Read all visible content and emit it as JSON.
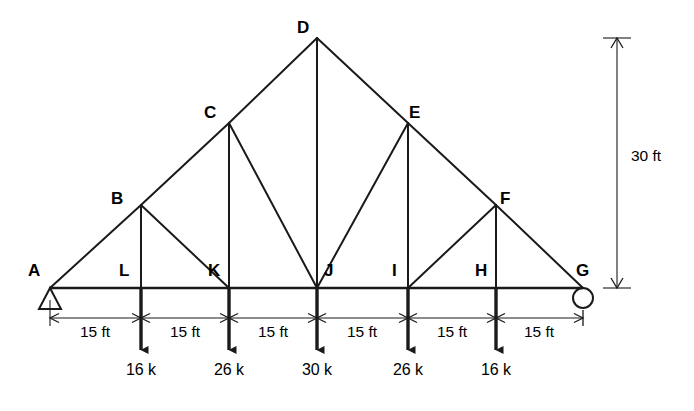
{
  "figure": {
    "type": "structural-truss-diagram",
    "background_color": "#ffffff",
    "line_color": "#1a1a1a"
  },
  "geometry": {
    "span_ft": 90,
    "height_ft": 30,
    "panel_length_ft": 15,
    "panel_count": 6
  },
  "nodes": [
    {
      "id": "A",
      "label": "A",
      "x": 50,
      "y": 288,
      "label_x": 28,
      "label_y": 262,
      "chord": "bottom"
    },
    {
      "id": "L",
      "label": "L",
      "x": 141,
      "y": 288,
      "label_x": 119,
      "label_y": 262,
      "chord": "bottom"
    },
    {
      "id": "K",
      "label": "K",
      "x": 229,
      "y": 288,
      "label_x": 208,
      "label_y": 262,
      "chord": "bottom"
    },
    {
      "id": "J",
      "label": "J",
      "x": 317,
      "y": 288,
      "label_x": 324,
      "label_y": 262,
      "chord": "bottom"
    },
    {
      "id": "I",
      "label": "I",
      "x": 408,
      "y": 288,
      "label_x": 392,
      "label_y": 262,
      "chord": "bottom"
    },
    {
      "id": "H",
      "label": "H",
      "x": 496,
      "y": 288,
      "label_x": 475,
      "label_y": 262,
      "chord": "bottom"
    },
    {
      "id": "G",
      "label": "G",
      "x": 583,
      "y": 288,
      "label_x": 576,
      "label_y": 262,
      "chord": "bottom"
    },
    {
      "id": "B",
      "label": "B",
      "x": 141,
      "y": 205,
      "label_x": 111,
      "label_y": 190,
      "chord": "top"
    },
    {
      "id": "C",
      "label": "C",
      "x": 229,
      "y": 123,
      "label_x": 204,
      "label_y": 104,
      "chord": "top"
    },
    {
      "id": "D",
      "label": "D",
      "x": 317,
      "y": 38,
      "label_x": 297,
      "label_y": 19,
      "chord": "top"
    },
    {
      "id": "E",
      "label": "E",
      "x": 408,
      "y": 123,
      "label_x": 409,
      "label_y": 104,
      "chord": "top"
    },
    {
      "id": "F",
      "label": "F",
      "x": 496,
      "y": 205,
      "label_x": 500,
      "label_y": 190,
      "chord": "top"
    }
  ],
  "members": {
    "bottom_chord": [
      [
        "A",
        "L"
      ],
      [
        "L",
        "K"
      ],
      [
        "K",
        "J"
      ],
      [
        "J",
        "I"
      ],
      [
        "I",
        "H"
      ],
      [
        "H",
        "G"
      ]
    ],
    "top_chord": [
      [
        "A",
        "B"
      ],
      [
        "B",
        "C"
      ],
      [
        "C",
        "D"
      ],
      [
        "D",
        "E"
      ],
      [
        "E",
        "F"
      ],
      [
        "F",
        "G"
      ]
    ],
    "verticals": [
      [
        "B",
        "L"
      ],
      [
        "C",
        "K"
      ],
      [
        "D",
        "J"
      ],
      [
        "E",
        "I"
      ],
      [
        "F",
        "H"
      ]
    ],
    "diagonals": [
      [
        "B",
        "K"
      ],
      [
        "C",
        "J"
      ],
      [
        "E",
        "J"
      ],
      [
        "F",
        "I"
      ]
    ]
  },
  "supports": [
    {
      "node": "A",
      "kind": "pin-support",
      "shape": "triangle",
      "x": 50,
      "y": 288
    },
    {
      "node": "G",
      "kind": "roller-support",
      "shape": "circle",
      "x": 583,
      "y": 288
    }
  ],
  "loads": [
    {
      "node": "L",
      "label": "16 k",
      "value": 16,
      "unit": "k",
      "x": 141,
      "label_x": 141,
      "label_y": 368,
      "direction": "down"
    },
    {
      "node": "K",
      "label": "26 k",
      "value": 26,
      "unit": "k",
      "x": 229,
      "label_x": 229,
      "label_y": 368,
      "direction": "down"
    },
    {
      "node": "J",
      "label": "30 k",
      "value": 30,
      "unit": "k",
      "x": 317,
      "label_x": 317,
      "label_y": 368,
      "direction": "down"
    },
    {
      "node": "I",
      "label": "26 k",
      "value": 26,
      "unit": "k",
      "x": 408,
      "label_x": 408,
      "label_y": 368,
      "direction": "down"
    },
    {
      "node": "H",
      "label": "16 k",
      "value": 16,
      "unit": "k",
      "x": 496,
      "label_x": 496,
      "label_y": 368,
      "direction": "down"
    }
  ],
  "dimensions": {
    "horizontal": [
      {
        "label": "15 ft",
        "from": 50,
        "to": 141,
        "label_x": 95,
        "label_y": 330
      },
      {
        "label": "15 ft",
        "from": 141,
        "to": 229,
        "label_x": 185,
        "label_y": 330
      },
      {
        "label": "15 ft",
        "from": 229,
        "to": 317,
        "label_x": 273,
        "label_y": 330
      },
      {
        "label": "15 ft",
        "from": 317,
        "to": 408,
        "label_x": 362,
        "label_y": 330
      },
      {
        "label": "15 ft",
        "from": 408,
        "to": 496,
        "label_x": 452,
        "label_y": 330
      },
      {
        "label": "15 ft",
        "from": 496,
        "to": 583,
        "label_x": 539,
        "label_y": 330
      }
    ],
    "vertical": {
      "label": "30 ft",
      "x": 617,
      "top": 38,
      "bottom": 288,
      "label_x": 631,
      "label_y": 155
    }
  }
}
